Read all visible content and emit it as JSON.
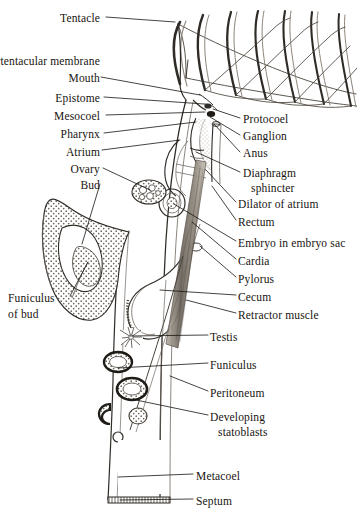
{
  "figure": {
    "style": "black-and-white scientific line drawing with stippled and hatched shading",
    "ink_color": "#17140f",
    "line_color": "#3a3630",
    "shade_color": "#8d857a",
    "background_color": "#ffffff",
    "width": 357,
    "height": 514
  },
  "labels_left": [
    {
      "id": "tentacle",
      "text": "Tentacle",
      "x": 100,
      "y": 12,
      "leader": [
        [
          106,
          17
        ],
        [
          175,
          22
        ]
      ]
    },
    {
      "id": "intertentacular-membrane",
      "text": "Intertentacular membrane",
      "x": 100,
      "y": 55,
      "leader": [
        [
          106,
          60
        ],
        [
          186,
          78
        ]
      ]
    },
    {
      "id": "mouth",
      "text": "Mouth",
      "x": 100,
      "y": 72,
      "leader": [
        [
          101,
          77
        ],
        [
          200,
          95
        ]
      ]
    },
    {
      "id": "epistome",
      "text": "Epistome",
      "x": 100,
      "y": 92,
      "leader": [
        [
          104,
          97
        ],
        [
          204,
          104
        ]
      ]
    },
    {
      "id": "mesocoel",
      "text": "Mesocoel",
      "x": 100,
      "y": 110,
      "leader": [
        [
          106,
          115
        ],
        [
          205,
          112
        ]
      ]
    },
    {
      "id": "pharynx",
      "text": "Pharynx",
      "x": 100,
      "y": 128,
      "leader": [
        [
          104,
          133
        ],
        [
          196,
          122
        ]
      ]
    },
    {
      "id": "atrium",
      "text": "Atrium",
      "x": 100,
      "y": 146,
      "leader": [
        [
          102,
          150
        ],
        [
          180,
          140
        ]
      ]
    },
    {
      "id": "ovary",
      "text": "Ovary",
      "x": 100,
      "y": 163,
      "leader": [
        [
          103,
          168
        ],
        [
          150,
          190
        ]
      ]
    },
    {
      "id": "bud",
      "text": "Bud",
      "x": 100,
      "y": 179,
      "leader": [
        [
          100,
          184
        ],
        [
          82,
          244
        ]
      ]
    }
  ],
  "labels_left_block": [
    {
      "id": "funiculus-of-bud",
      "line1": "Funiculus",
      "line2": "of bud",
      "x": 8,
      "y": 292,
      "leader": [
        [
          70,
          296
        ],
        [
          88,
          262
        ]
      ]
    }
  ],
  "labels_right": [
    {
      "id": "protocoel",
      "text": "Protocoel",
      "x": 243,
      "y": 113,
      "leader": [
        [
          240,
          118
        ],
        [
          213,
          109
        ]
      ]
    },
    {
      "id": "ganglion",
      "text": "Ganglion",
      "x": 243,
      "y": 130,
      "leader": [
        [
          240,
          135
        ],
        [
          210,
          117
        ]
      ]
    },
    {
      "id": "anus",
      "text": "Anus",
      "x": 243,
      "y": 147,
      "leader": [
        [
          240,
          152
        ],
        [
          214,
          124
        ]
      ]
    },
    {
      "id": "diaphragm-sphincter",
      "line1": "Diaphragm",
      "line2": "sphincter",
      "text": "Diaphragm",
      "x": 243,
      "y": 167,
      "leader": [
        [
          240,
          172
        ],
        [
          196,
          152
        ]
      ]
    },
    {
      "id": "dilator-of-atrium",
      "text": "Dilator of atrium",
      "x": 238,
      "y": 198,
      "leader": [
        [
          236,
          202
        ],
        [
          206,
          170
        ]
      ]
    },
    {
      "id": "rectum",
      "text": "Rectum",
      "x": 238,
      "y": 216,
      "leader": [
        [
          236,
          220
        ],
        [
          212,
          186
        ]
      ]
    },
    {
      "id": "embryo-in-embryo-sac",
      "text": "Embryo in embryo sac",
      "x": 238,
      "y": 237,
      "leader": [
        [
          236,
          241
        ],
        [
          174,
          204
        ]
      ]
    },
    {
      "id": "cardia",
      "text": "Cardia",
      "x": 238,
      "y": 255,
      "leader": [
        [
          236,
          259
        ],
        [
          192,
          222
        ]
      ]
    },
    {
      "id": "pylorus",
      "text": "Pylorus",
      "x": 238,
      "y": 273,
      "leader": [
        [
          236,
          277
        ],
        [
          200,
          246
        ]
      ]
    },
    {
      "id": "cecum",
      "text": "Cecum",
      "x": 238,
      "y": 291,
      "leader": [
        [
          236,
          295
        ],
        [
          160,
          290
        ]
      ]
    },
    {
      "id": "retractor-muscle",
      "text": "Retractor muscle",
      "x": 238,
      "y": 309,
      "leader": [
        [
          236,
          313
        ],
        [
          186,
          300
        ]
      ]
    },
    {
      "id": "testis",
      "text": "Testis",
      "x": 210,
      "y": 331,
      "leader": [
        [
          208,
          335
        ],
        [
          130,
          336
        ]
      ]
    },
    {
      "id": "funiculus",
      "text": "Funiculus",
      "x": 210,
      "y": 359,
      "leader": [
        [
          208,
          363
        ],
        [
          118,
          368
        ]
      ]
    },
    {
      "id": "peritoneum",
      "text": "Peritoneum",
      "x": 210,
      "y": 387,
      "leader": [
        [
          208,
          391
        ],
        [
          170,
          376
        ]
      ]
    },
    {
      "id": "developing-statoblasts",
      "line1": "Developing",
      "line2": "statoblasts",
      "text": "Developing",
      "x": 210,
      "y": 411,
      "leader": [
        [
          208,
          415
        ],
        [
          136,
          400
        ]
      ]
    },
    {
      "id": "metacoel",
      "text": "Metacoel",
      "x": 196,
      "y": 470,
      "leader": [
        [
          193,
          474
        ],
        [
          118,
          477
        ]
      ]
    },
    {
      "id": "septum",
      "text": "Septum",
      "x": 196,
      "y": 495,
      "leader": [
        [
          193,
          499
        ],
        [
          120,
          500
        ]
      ]
    }
  ],
  "anatomy_parts": [
    "tentacle-crown",
    "intertentacular-membrane",
    "mouth",
    "epistome",
    "mesocoel",
    "pharynx",
    "atrium",
    "ovary",
    "bud",
    "funiculus-of-bud",
    "protocoel",
    "ganglion",
    "anus",
    "diaphragm-sphincter",
    "dilator-of-atrium",
    "rectum",
    "embryo-sac",
    "cardia",
    "pylorus",
    "cecum",
    "retractor-muscle",
    "testis",
    "funiculus",
    "peritoneum",
    "developing-statoblasts",
    "metacoel",
    "septum",
    "body-wall"
  ]
}
